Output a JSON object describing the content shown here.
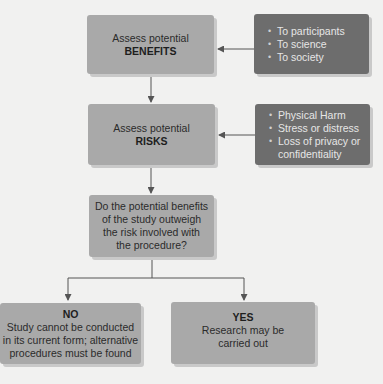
{
  "colors": {
    "background": "#f1f1f0",
    "light_box": "#a9a9a9",
    "dark_box": "#6d6d6d",
    "line": "#555555"
  },
  "benefits_box": {
    "line1": "Assess potential",
    "line2": "BENEFITS"
  },
  "benefits_list": {
    "items": [
      "To participants",
      "To science",
      "To society"
    ]
  },
  "risks_box": {
    "line1": "Assess potential",
    "line2": "RISKS"
  },
  "risks_list": {
    "items": [
      "Physical Harm",
      "Stress or distress",
      "Loss of privacy or",
      "confidentiality"
    ]
  },
  "question_box": {
    "lines": [
      "Do the potential benefits",
      "of the study outweigh",
      "the risk involved with",
      "the procedure?"
    ]
  },
  "no_box": {
    "title": "NO",
    "lines": [
      "Study cannot be conducted",
      "in its current form; alternative",
      "procedures must be found"
    ]
  },
  "yes_box": {
    "title": "YES",
    "lines": [
      "Research may be",
      "carried out"
    ]
  }
}
